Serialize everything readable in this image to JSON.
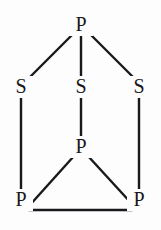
{
  "figure": {
    "kind": "chemical-structure-diagram",
    "width": 161,
    "height": 230,
    "background_color": "#fdfdfd",
    "line_color": "#1a181c",
    "label_color": "#18161a"
  },
  "atoms": [
    {
      "id": "p-apex",
      "label": "P",
      "element": "P",
      "x": 81,
      "y": 25,
      "role": "apex-phosphorus"
    },
    {
      "id": "s-left",
      "label": "S",
      "element": "S",
      "x": 21,
      "y": 87,
      "role": "bridging-sulfur-left"
    },
    {
      "id": "s-center",
      "label": "S",
      "element": "S",
      "x": 81,
      "y": 87,
      "role": "bridging-sulfur-center"
    },
    {
      "id": "s-right",
      "label": "S",
      "element": "S",
      "x": 139,
      "y": 87,
      "role": "bridging-sulfur-right"
    },
    {
      "id": "p-center",
      "label": "P",
      "element": "P",
      "x": 81,
      "y": 147,
      "role": "basal-phosphorus-rear"
    },
    {
      "id": "p-bottom-left",
      "label": "P",
      "element": "P",
      "x": 21,
      "y": 200,
      "role": "basal-phosphorus-left"
    },
    {
      "id": "p-bottom-right",
      "label": "P",
      "element": "P",
      "x": 139,
      "y": 200,
      "role": "basal-phosphorus-right"
    }
  ],
  "bonds": [
    {
      "id": "bond-apex-sleft",
      "from": "p-apex",
      "to": "s-left",
      "x1": 74,
      "y1": 33,
      "x2": 28,
      "y2": 79,
      "type": "single"
    },
    {
      "id": "bond-apex-scenter",
      "from": "p-apex",
      "to": "s-center",
      "x1": 81,
      "y1": 36,
      "x2": 81,
      "y2": 77,
      "type": "single"
    },
    {
      "id": "bond-apex-sright",
      "from": "p-apex",
      "to": "s-right",
      "x1": 89,
      "y1": 33,
      "x2": 134,
      "y2": 78,
      "type": "single"
    },
    {
      "id": "bond-sleft-pbl",
      "from": "s-left",
      "to": "p-bottom-left",
      "x1": 21,
      "y1": 98,
      "x2": 21,
      "y2": 190,
      "type": "single"
    },
    {
      "id": "bond-scenter-pcenter",
      "from": "s-center",
      "to": "p-center",
      "x1": 81,
      "y1": 98,
      "x2": 81,
      "y2": 137,
      "type": "single"
    },
    {
      "id": "bond-sright-pbr",
      "from": "s-right",
      "to": "p-bottom-right",
      "x1": 139,
      "y1": 98,
      "x2": 139,
      "y2": 190,
      "type": "single"
    },
    {
      "id": "bond-pcenter-pbl",
      "from": "p-center",
      "to": "p-bottom-left",
      "x1": 74,
      "y1": 156,
      "x2": 29,
      "y2": 206,
      "type": "single"
    },
    {
      "id": "bond-pcenter-pbr",
      "from": "p-center",
      "to": "p-bottom-right",
      "x1": 88,
      "y1": 156,
      "x2": 132,
      "y2": 204,
      "type": "single"
    },
    {
      "id": "bond-pbl-pbr",
      "from": "p-bottom-left",
      "to": "p-bottom-right",
      "x1": 29,
      "y1": 210,
      "x2": 132,
      "y2": 210,
      "type": "single"
    }
  ]
}
